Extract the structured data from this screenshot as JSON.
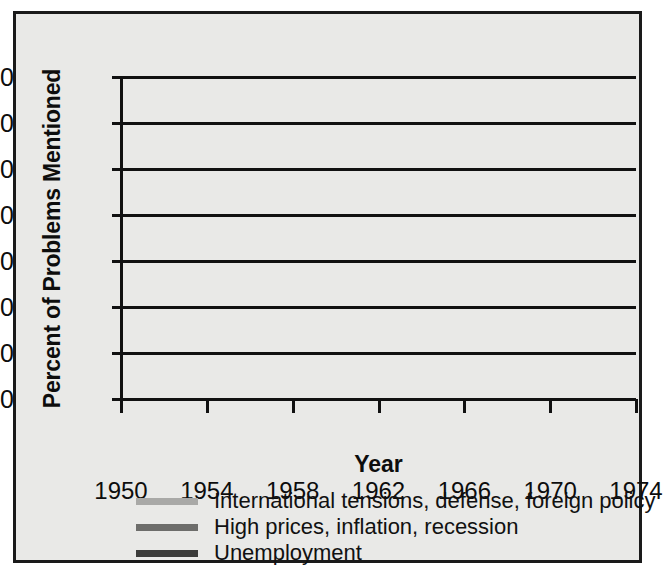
{
  "figure": {
    "background_color": "#e9e9e7",
    "border_color": "#1a1a1a"
  },
  "axes": {
    "y_title": "Percent of Problems Mentioned",
    "x_title": "Year",
    "y_ticks": [
      "0",
      "10",
      "20",
      "30",
      "40",
      "50",
      "60",
      "70"
    ],
    "x_ticks": [
      "1950",
      "1954",
      "1958",
      "1962",
      "1966",
      "1970",
      "1974"
    ]
  },
  "legend": {
    "items": [
      {
        "label": "International tensions, defense, foreign policy",
        "color": "#a9a9a7"
      },
      {
        "label": "High prices, inflation, recession",
        "color": "#6d6d6b"
      },
      {
        "label": "Unemployment",
        "color": "#3c3c3a"
      }
    ]
  },
  "chart_data": {
    "type": "line",
    "title": "",
    "xlabel": "Year",
    "ylabel": "Percent of Problems Mentioned",
    "x": [
      1950,
      1954,
      1958,
      1962,
      1966,
      1970,
      1974
    ],
    "xlim": [
      1950,
      1974
    ],
    "ylim": [
      0,
      70
    ],
    "ytick_step": 10,
    "grid": "horizontal",
    "legend_position": "bottom-center",
    "series": [
      {
        "name": "International tensions, defense, foreign policy",
        "color": "#a9a9a7",
        "values": [
          29,
          46,
          65,
          7,
          14,
          25,
          5
        ]
      },
      {
        "name": "High prices, inflation, recession",
        "color": "#6d6d6b",
        "values": [
          1,
          4,
          14,
          30,
          20,
          10,
          4
        ]
      },
      {
        "name": "Unemployment",
        "color": "#3c3c3a",
        "values": [
          16.5,
          14,
          4,
          33.5,
          14,
          10,
          17
        ]
      }
    ]
  }
}
